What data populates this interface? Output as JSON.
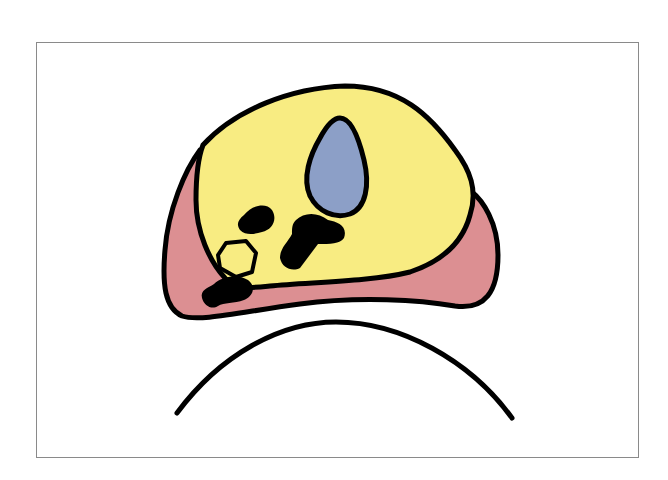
{
  "diagram": {
    "type": "anatomical cross-section schematic",
    "labels": [],
    "colors": {
      "background": "#ffffff",
      "frame": "#8a8a8a",
      "outer_region": "#dc8f92",
      "inner_region": "#f8ec82",
      "oval_structure": "#8c9fc7",
      "small_hexagon": "#f8ec82",
      "dark_masses": "#000000",
      "outline": "#000000"
    },
    "elements": [
      {
        "id": "outer-region",
        "shape": "rounded irregular mass",
        "fill": "pink"
      },
      {
        "id": "inner-region",
        "shape": "large rounded mass",
        "fill": "yellow"
      },
      {
        "id": "oval-structure",
        "shape": "teardrop",
        "fill": "blue-gray"
      },
      {
        "id": "small-hexagon",
        "shape": "hexagon",
        "fill": "yellow"
      },
      {
        "id": "dark-mass-1",
        "shape": "blob",
        "fill": "black"
      },
      {
        "id": "dark-mass-2",
        "shape": "irregular blob",
        "fill": "black"
      },
      {
        "id": "dark-mass-3",
        "shape": "blob",
        "fill": "black"
      },
      {
        "id": "lower-arc",
        "shape": "arc",
        "fill": "none"
      }
    ]
  }
}
